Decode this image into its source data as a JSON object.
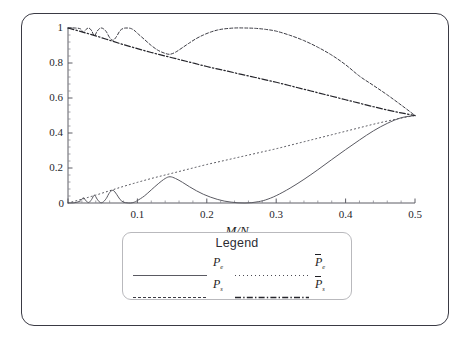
{
  "figure": {
    "border_color": "#3a3a44",
    "background": "#ffffff"
  },
  "axes": {
    "x_title": "M/N",
    "x_ticks": [
      "0",
      "0.1",
      "0.2",
      "0.3",
      "0.4",
      "0.5"
    ],
    "y_ticks": [
      "0",
      "0.2",
      "0.4",
      "0.6",
      "0.8",
      "1"
    ]
  },
  "legend": {
    "title": "Legend",
    "entries": [
      {
        "label_base": "P",
        "label_sub": "e",
        "overbar": false,
        "style": "solid",
        "col": 0,
        "row": 0
      },
      {
        "label_base": "P",
        "label_sub": "s",
        "overbar": false,
        "style": "dashed",
        "col": 0,
        "row": 1
      },
      {
        "label_base": "P",
        "label_sub": "e",
        "overbar": true,
        "style": "dotted",
        "col": 1,
        "row": 0
      },
      {
        "label_base": "P",
        "label_sub": "s",
        "overbar": true,
        "style": "dashdot",
        "col": 1,
        "row": 1
      }
    ]
  },
  "chart_data": {
    "type": "line",
    "title": "",
    "xlabel": "M/N",
    "ylabel": "",
    "xlim": [
      0,
      0.5
    ],
    "ylim": [
      0,
      1
    ],
    "grid": false,
    "legend_position": "below-axes",
    "x_ticks": [
      0,
      0.1,
      0.2,
      0.3,
      0.4,
      0.5
    ],
    "y_ticks": [
      0,
      0.2,
      0.4,
      0.6,
      0.8,
      1
    ],
    "series": [
      {
        "name": "P_e",
        "style": "solid",
        "color": "#5a5a62",
        "description": "Oscillatory lobes rising from 0 near x=0, peaks ~0.15 at x=0.147, dips to 0 near x=0.25, then rises smoothly to 0.5 at x=0.5",
        "x": [
          0.0,
          0.01,
          0.018,
          0.022,
          0.026,
          0.03,
          0.034,
          0.038,
          0.042,
          0.046,
          0.05,
          0.055,
          0.06,
          0.065,
          0.07,
          0.075,
          0.08,
          0.085,
          0.09,
          0.095,
          0.1,
          0.11,
          0.12,
          0.13,
          0.14,
          0.147,
          0.155,
          0.165,
          0.175,
          0.185,
          0.195,
          0.205,
          0.215,
          0.225,
          0.235,
          0.245,
          0.255,
          0.265,
          0.275,
          0.285,
          0.3,
          0.32,
          0.34,
          0.36,
          0.38,
          0.4,
          0.42,
          0.44,
          0.46,
          0.48,
          0.5
        ],
        "y": [
          0.0,
          0.002,
          0.012,
          0.03,
          0.012,
          0.003,
          0.02,
          0.045,
          0.022,
          0.004,
          0.004,
          0.025,
          0.06,
          0.072,
          0.05,
          0.02,
          0.005,
          0.001,
          0.0,
          0.004,
          0.014,
          0.04,
          0.075,
          0.11,
          0.14,
          0.15,
          0.14,
          0.118,
          0.093,
          0.07,
          0.05,
          0.034,
          0.021,
          0.011,
          0.005,
          0.001,
          0.0,
          0.002,
          0.008,
          0.018,
          0.042,
          0.085,
          0.135,
          0.19,
          0.248,
          0.305,
          0.36,
          0.412,
          0.455,
          0.487,
          0.5
        ]
      },
      {
        "name": "P_s",
        "style": "dashed",
        "color": "#3c3c44",
        "description": "Starts at 1, oscillating dips to ~0.85 near x=0.147, rises back to 1.0 around x=0.25-0.30, then falls to 0.5 at x=0.5",
        "x": [
          0.0,
          0.01,
          0.018,
          0.022,
          0.026,
          0.03,
          0.034,
          0.038,
          0.042,
          0.046,
          0.05,
          0.055,
          0.06,
          0.065,
          0.07,
          0.075,
          0.08,
          0.085,
          0.09,
          0.095,
          0.1,
          0.11,
          0.12,
          0.13,
          0.14,
          0.147,
          0.155,
          0.165,
          0.175,
          0.185,
          0.195,
          0.205,
          0.215,
          0.225,
          0.24,
          0.255,
          0.27,
          0.285,
          0.3,
          0.32,
          0.34,
          0.36,
          0.38,
          0.4,
          0.42,
          0.44,
          0.46,
          0.48,
          0.5
        ],
        "y": [
          1.0,
          1.0,
          0.995,
          0.975,
          0.992,
          1.0,
          0.985,
          0.955,
          0.982,
          0.998,
          0.998,
          0.98,
          0.945,
          0.93,
          0.952,
          0.985,
          0.998,
          1.0,
          0.998,
          0.988,
          0.97,
          0.935,
          0.9,
          0.872,
          0.855,
          0.85,
          0.862,
          0.888,
          0.915,
          0.94,
          0.96,
          0.976,
          0.988,
          0.995,
          1.0,
          1.0,
          0.998,
          0.992,
          0.982,
          0.958,
          0.928,
          0.89,
          0.845,
          0.79,
          0.725,
          0.672,
          0.618,
          0.56,
          0.5
        ]
      },
      {
        "name": "Pbar_e",
        "style": "dotted",
        "color": "#4a4a52",
        "description": "Smooth monotone increase from 0 at x=0 to 0.5 at x=0.5, passing ~0.15 at x=0.15 and ~0.26 at x=0.25",
        "x": [
          0.0,
          0.02,
          0.04,
          0.06,
          0.08,
          0.1,
          0.12,
          0.14,
          0.16,
          0.18,
          0.2,
          0.22,
          0.24,
          0.26,
          0.28,
          0.3,
          0.32,
          0.34,
          0.36,
          0.38,
          0.4,
          0.42,
          0.44,
          0.46,
          0.48,
          0.5
        ],
        "y": [
          0.0,
          0.022,
          0.045,
          0.07,
          0.095,
          0.118,
          0.14,
          0.16,
          0.18,
          0.2,
          0.22,
          0.238,
          0.256,
          0.274,
          0.292,
          0.31,
          0.33,
          0.35,
          0.37,
          0.39,
          0.41,
          0.43,
          0.45,
          0.468,
          0.485,
          0.5
        ]
      },
      {
        "name": "Pbar_s",
        "style": "dashdot",
        "color": "#26262c",
        "description": "Smooth monotone decrease from 1 at x=0 to 0.5 at x=0.5, about 0.85 at x=0.15 and 0.74 at x=0.25",
        "x": [
          0.0,
          0.02,
          0.04,
          0.06,
          0.08,
          0.1,
          0.12,
          0.14,
          0.16,
          0.18,
          0.2,
          0.22,
          0.24,
          0.26,
          0.28,
          0.3,
          0.32,
          0.34,
          0.36,
          0.38,
          0.4,
          0.42,
          0.44,
          0.46,
          0.48,
          0.5
        ],
        "y": [
          1.0,
          0.978,
          0.955,
          0.93,
          0.905,
          0.882,
          0.86,
          0.84,
          0.82,
          0.8,
          0.78,
          0.762,
          0.744,
          0.726,
          0.708,
          0.69,
          0.67,
          0.65,
          0.63,
          0.61,
          0.59,
          0.57,
          0.55,
          0.532,
          0.515,
          0.5
        ]
      }
    ]
  }
}
